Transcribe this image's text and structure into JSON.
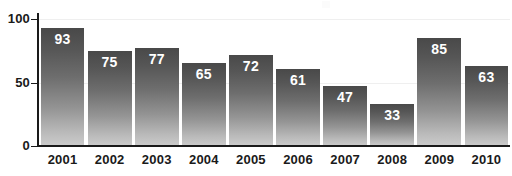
{
  "chart_data": {
    "type": "bar",
    "title": "",
    "subtitle": "",
    "xlabel": "",
    "ylabel": "",
    "categories": [
      "2001",
      "2002",
      "2003",
      "2004",
      "2005",
      "2006",
      "2007",
      "2008",
      "2009",
      "2010"
    ],
    "values": [
      93,
      75,
      77,
      65,
      72,
      61,
      47,
      33,
      85,
      63
    ],
    "value_labels": [
      "93",
      "75",
      "77",
      "65",
      "72",
      "61",
      "47",
      "33",
      "85",
      "63"
    ],
    "ylim": [
      0,
      100
    ],
    "y_ticks": [
      0,
      50,
      100
    ],
    "y_tick_labels": [
      "0",
      "50",
      "100"
    ],
    "grid": "horizontal-faint",
    "legend": "none",
    "bar_color_top": "#494949",
    "bar_color_bottom": "#cccccc",
    "value_label_color": "#ffffff",
    "axis_color": "#1a1a1a",
    "gridline_color": "#efefef",
    "background": "#ffffff"
  },
  "axis": {
    "y_labels": {
      "top": "100",
      "mid": "50",
      "zero": "0"
    }
  }
}
